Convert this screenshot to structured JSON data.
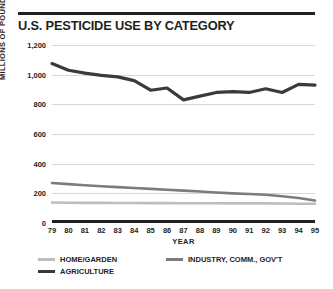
{
  "title": "U.S. PESTICIDE USE BY CATEGORY",
  "chart_data": {
    "type": "line",
    "title": "U.S. PESTICIDE USE BY CATEGORY",
    "xlabel": "YEAR",
    "ylabel": "MILLIONS OF POUNDS",
    "ylim": [
      0,
      1200
    ],
    "yticks": [
      0,
      200,
      400,
      600,
      800,
      1000,
      1200
    ],
    "ytick_labels": [
      "0",
      "200",
      "400",
      "600",
      "800",
      "1,000",
      "1,200"
    ],
    "grid": true,
    "legend_position": "bottom-left",
    "categories": [
      "79",
      "80",
      "81",
      "82",
      "83",
      "84",
      "85",
      "86",
      "87",
      "88",
      "89",
      "90",
      "91",
      "92",
      "93",
      "94",
      "95"
    ],
    "series": [
      {
        "name": "AGRICULTURE",
        "color": "#3a3a3a",
        "values": [
          1075,
          1030,
          1010,
          995,
          985,
          960,
          895,
          910,
          830,
          855,
          880,
          885,
          880,
          905,
          880,
          935,
          930
        ]
      },
      {
        "name": "INDUSTRY, COMM., GOV'T",
        "color": "#7c7c7c",
        "values": [
          270,
          262,
          255,
          248,
          242,
          236,
          230,
          224,
          218,
          212,
          206,
          200,
          195,
          190,
          180,
          168,
          152
        ]
      },
      {
        "name": "HOME/GARDEN",
        "color": "#bdbdbd",
        "values": [
          138,
          137,
          136,
          136,
          135,
          135,
          134,
          134,
          133,
          133,
          133,
          132,
          132,
          132,
          131,
          130,
          130
        ]
      }
    ]
  },
  "legend": [
    {
      "label": "HOME/GARDEN",
      "color": "#bdbdbd"
    },
    {
      "label": "INDUSTRY, COMM., GOV'T",
      "color": "#7c7c7c"
    },
    {
      "label": "AGRICULTURE",
      "color": "#3a3a3a"
    }
  ]
}
